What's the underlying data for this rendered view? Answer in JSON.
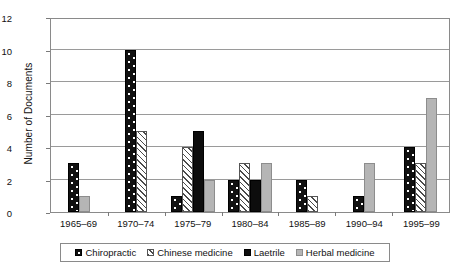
{
  "chart_data": {
    "type": "bar",
    "title": "",
    "xlabel": "",
    "ylabel": "Number of Documents",
    "ylim": [
      0,
      12
    ],
    "yticks": [
      0,
      2,
      4,
      6,
      8,
      10,
      12
    ],
    "grid": true,
    "legend_position": "bottom",
    "categories": [
      "1965–69",
      "1970–74",
      "1975–79",
      "1980–84",
      "1985–89",
      "1990–94",
      "1995–99"
    ],
    "series": [
      {
        "name": "Chiropractic",
        "fill": "black-with-white-dots",
        "color": "#111111",
        "values": [
          3,
          10,
          1,
          2,
          2,
          1,
          4
        ]
      },
      {
        "name": "Chinese medicine",
        "fill": "white-diagonal-hatch",
        "color": "#ffffff",
        "values": [
          0,
          5,
          4,
          3,
          1,
          0,
          3
        ]
      },
      {
        "name": "Laetrile",
        "fill": "solid-black",
        "color": "#0d0d0d",
        "values": [
          0,
          0,
          5,
          2,
          0,
          0,
          0
        ]
      },
      {
        "name": "Herbal medicine",
        "fill": "solid-light-gray",
        "color": "#b5b5b5",
        "values": [
          1,
          0,
          2,
          3,
          0,
          3,
          7
        ]
      }
    ]
  }
}
